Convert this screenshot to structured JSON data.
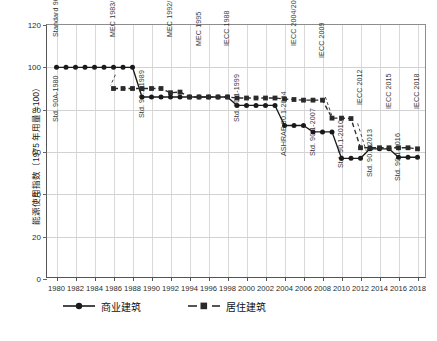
{
  "chart_data": {
    "type": "line",
    "title": "",
    "xlabel": "",
    "ylabel": "能源使用指数（1975 年用量 =100）",
    "xlim": [
      1979,
      2019
    ],
    "ylim": [
      0,
      120
    ],
    "yticks": [
      0,
      20,
      40,
      60,
      80,
      100,
      120
    ],
    "grid": true,
    "legend_position": "bottom",
    "x": [
      1980,
      1981,
      1982,
      1983,
      1984,
      1985,
      1986,
      1987,
      1988,
      1989,
      1990,
      1991,
      1992,
      1993,
      1994,
      1995,
      1996,
      1997,
      1998,
      1999,
      2000,
      2001,
      2002,
      2003,
      2004,
      2005,
      2006,
      2007,
      2008,
      2009,
      2010,
      2011,
      2012,
      2013,
      2014,
      2015,
      2016,
      2017,
      2018
    ],
    "xticks": [
      1980,
      1982,
      1984,
      1986,
      1988,
      1990,
      1992,
      1994,
      1996,
      1998,
      2000,
      2002,
      2004,
      2006,
      2008,
      2010,
      2012,
      2014,
      2016,
      2018
    ],
    "series": [
      {
        "name": "商业建筑",
        "marker": "circle",
        "linestyle": "solid",
        "color": "#1a1a1a",
        "values": [
          100,
          100,
          100,
          100,
          100,
          100,
          100,
          100,
          100,
          86,
          86,
          86,
          86,
          86,
          86,
          86,
          86,
          86,
          86,
          82,
          82,
          82,
          82,
          82,
          72.5,
          72.5,
          72.5,
          69.5,
          69.5,
          69.5,
          57,
          57,
          57,
          61.5,
          61.5,
          61.5,
          57.5,
          57.5,
          57.5
        ]
      },
      {
        "name": "居住建筑",
        "marker": "square",
        "linestyle": "dashed",
        "color": "#2a2a2a",
        "values": [
          null,
          null,
          null,
          null,
          null,
          null,
          90,
          90,
          90,
          90,
          90,
          90,
          88,
          88.3,
          86,
          86,
          86,
          86,
          86,
          85.5,
          85.5,
          85.5,
          85.5,
          85.5,
          85,
          84.8,
          84.5,
          84.5,
          84.5,
          76,
          76,
          75.8,
          62,
          62,
          62,
          62,
          62,
          62,
          61.5
        ]
      }
    ],
    "annotations": [
      {
        "text": "Std. 90A-1980",
        "x": 1980,
        "y_top": 78
      },
      {
        "text": "Standard 90-75",
        "x": 1980,
        "y_top": 118
      },
      {
        "text": "MEC 1983/1986",
        "x": 1986,
        "y_top": 118
      },
      {
        "text": "Std. 90.1-1989",
        "x": 1989,
        "y_top": 80
      },
      {
        "text": "MEC 1992/1993",
        "x": 1992,
        "y_top": 118
      },
      {
        "text": "MEC 1995",
        "x": 1995,
        "y_top": 114
      },
      {
        "text": "IECC 1988",
        "x": 1998,
        "y_top": 114
      },
      {
        "text": "Std. 90.1-1999",
        "x": 1999,
        "y_top": 78
      },
      {
        "text": "ASHRAE 90.1-2004",
        "x": 2004,
        "y_top": 62
      },
      {
        "text": "IECC 2004/2006",
        "x": 2005,
        "y_top": 114
      },
      {
        "text": "Std. 90.1-2007",
        "x": 2007,
        "y_top": 62
      },
      {
        "text": "IECC 2009",
        "x": 2008,
        "y_top": 108
      },
      {
        "text": "Std. 90.1-2010",
        "x": 2010,
        "y_top": 56
      },
      {
        "text": "IECC 2012",
        "x": 2012,
        "y_top": 86
      },
      {
        "text": "Std. 90.1-2013",
        "x": 2013,
        "y_top": 52
      },
      {
        "text": "IECC 2015",
        "x": 2015,
        "y_top": 84
      },
      {
        "text": "Std. 90.1-2016",
        "x": 2016,
        "y_top": 50
      },
      {
        "text": "IECC 2018",
        "x": 2018,
        "y_top": 84
      }
    ],
    "leader_lines": [
      {
        "from_label": "IECC 2009",
        "x1": 2008.3,
        "y1": 86,
        "x2": 2009.0,
        "y2": 77.0
      },
      {
        "from_label": "IECC 2012",
        "x1": 2011.7,
        "y1": 73.5,
        "x2": 2012.6,
        "y2": 60.5
      },
      {
        "from_label": "MEC 1983/1986",
        "x1": 1986.2,
        "y1": 96.5,
        "x2": 1985.7,
        "y2": 91.5
      }
    ]
  },
  "axis": {
    "y_tick_labels": [
      "120",
      "100",
      "80",
      "60",
      "40",
      "20",
      "0"
    ],
    "x_tick_labels": [
      "1980",
      "1982",
      "1984",
      "1986",
      "1988",
      "1990",
      "1992",
      "1994",
      "1996",
      "1998",
      "2000",
      "2002",
      "2004",
      "2006",
      "2008",
      "2010",
      "2012",
      "2014",
      "2016",
      "2018"
    ]
  },
  "legend": {
    "items": [
      {
        "label": "商业建筑",
        "marker": "circle",
        "linestyle": "solid"
      },
      {
        "label": "居住建筑",
        "marker": "square",
        "linestyle": "dashed"
      }
    ]
  },
  "annotation_labels": {
    "a0": "Std. 90A-1980",
    "a1": "Standard 90-75",
    "a2": "MEC 1983/1986",
    "a3": "Std. 90.1-1989",
    "a4": "MEC 1992/1993",
    "a5": "MEC 1995",
    "a6": "IECC 1988",
    "a7": "Std. 90.1-1999",
    "a8": "Std. 90.1-2004",
    "a9": "IECC 2004/2006",
    "a10": "Std. 90.1-2007",
    "a11": "IECC 2009",
    "a12": "Std. 90.1-2010",
    "a13": "IECC 2012",
    "a14": "Std. 90.1-2013",
    "a15": "IECC 2015",
    "a16": "Std. 90.1-2016",
    "a17": "IECC 2018"
  }
}
